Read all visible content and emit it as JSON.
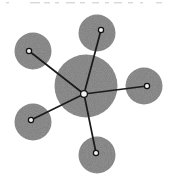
{
  "figure": {
    "type": "node-link-diagram",
    "canvas": {
      "width": 180,
      "height": 187
    },
    "background_color": "#ffffff",
    "node_fill_color": "#808080",
    "edge_color": "#1a1a1a",
    "marker_fill_color": "#f2f2f2",
    "marker_stroke_color": "#111111",
    "edge_width": 1.7,
    "marker_radius": 2.6,
    "hub": {
      "id": "hub",
      "label": "central-node",
      "cx": 86,
      "cy": 86,
      "r": 31.5,
      "marker_x": 84,
      "marker_y": 94
    },
    "nodes": [
      {
        "id": "n1",
        "label": "node-top",
        "cx": 97,
        "cy": 33,
        "r": 18.5,
        "marker_x": 101,
        "marker_y": 30
      },
      {
        "id": "n2",
        "label": "node-upper-left",
        "cx": 33,
        "cy": 51,
        "r": 18.5,
        "marker_x": 29,
        "marker_y": 51
      },
      {
        "id": "n3",
        "label": "node-right",
        "cx": 144,
        "cy": 86,
        "r": 18.5,
        "marker_x": 147,
        "marker_y": 86
      },
      {
        "id": "n4",
        "label": "node-lower-left",
        "cx": 33,
        "cy": 122,
        "r": 18.5,
        "marker_x": 31,
        "marker_y": 120
      },
      {
        "id": "n5",
        "label": "node-bottom",
        "cx": 97,
        "cy": 155,
        "r": 18.5,
        "marker_x": 96,
        "marker_y": 153
      }
    ],
    "edges": [
      {
        "id": "e1",
        "label": "edge-hub-to-top",
        "x1": 84,
        "y1": 94,
        "x2": 101,
        "y2": 30
      },
      {
        "id": "e2",
        "label": "edge-hub-to-upper-left",
        "x1": 84,
        "y1": 94,
        "x2": 29,
        "y2": 51
      },
      {
        "id": "e3",
        "label": "edge-hub-to-right",
        "x1": 84,
        "y1": 94,
        "x2": 147,
        "y2": 86
      },
      {
        "id": "e4",
        "label": "edge-hub-to-lower-left",
        "x1": 84,
        "y1": 94,
        "x2": 31,
        "y2": 120
      },
      {
        "id": "e5",
        "label": "edge-hub-to-bottom",
        "x1": 84,
        "y1": 94,
        "x2": 96,
        "y2": 153
      }
    ],
    "artifacts": {
      "top_speckle_color": "#d8d8d8",
      "note": "faint horizontal scan speckles along the top edge of the scanned figure"
    }
  },
  "chart_data": {
    "type": "scatter",
    "title": "",
    "xlabel": "",
    "ylabel": "",
    "grid": false,
    "legend": "none",
    "xlim": [
      0,
      180
    ],
    "ylim": [
      0,
      187
    ],
    "categories": [
      "hub",
      "node-top",
      "node-upper-left",
      "node-right",
      "node-lower-left",
      "node-bottom"
    ],
    "series": [
      {
        "name": "node-x",
        "values": [
          86,
          97,
          33,
          144,
          33,
          97
        ]
      },
      {
        "name": "node-y",
        "values": [
          86,
          33,
          51,
          86,
          122,
          155
        ]
      },
      {
        "name": "node-radius",
        "values": [
          31.5,
          18.5,
          18.5,
          18.5,
          18.5,
          18.5
        ]
      },
      {
        "name": "degree",
        "values": [
          5,
          1,
          1,
          1,
          1,
          1
        ]
      }
    ],
    "annotations": [
      "edge-hub-to-top",
      "edge-hub-to-upper-left",
      "edge-hub-to-right",
      "edge-hub-to-lower-left",
      "edge-hub-to-bottom"
    ]
  }
}
